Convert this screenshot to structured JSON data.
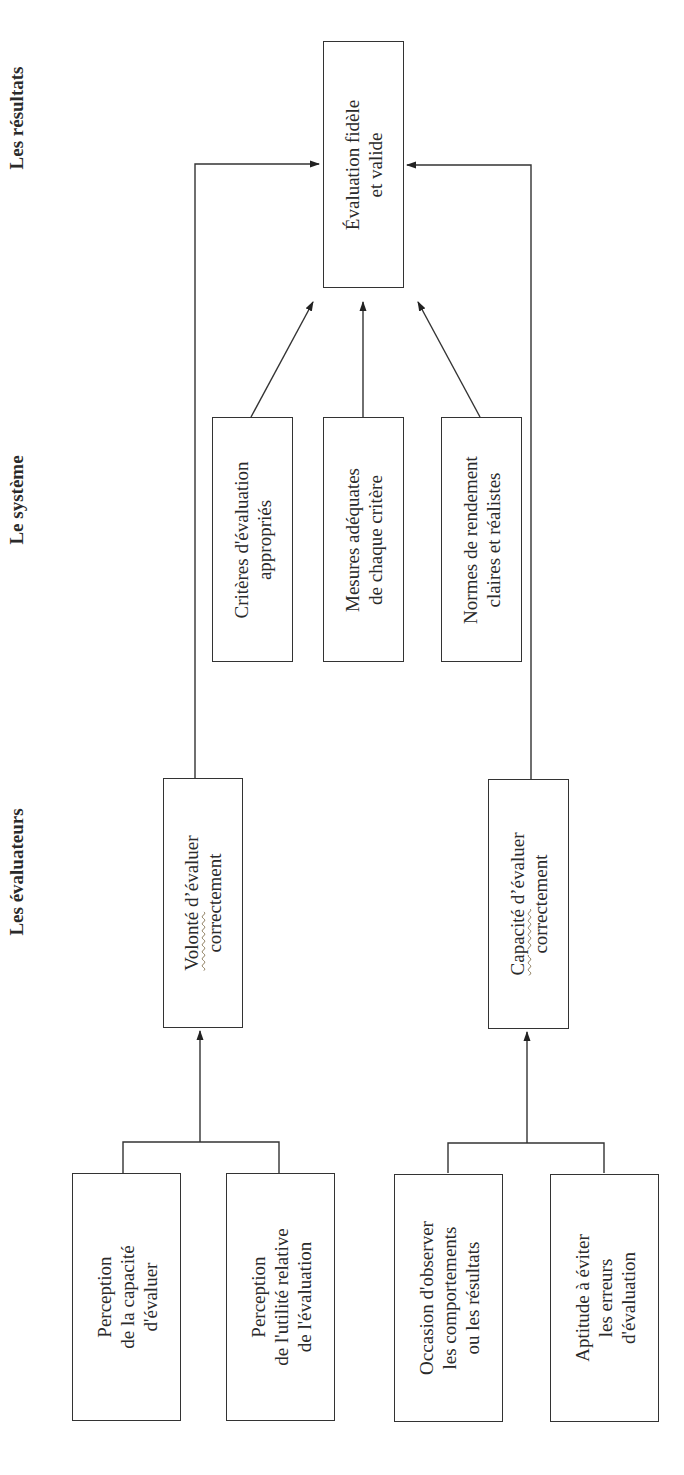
{
  "headers": {
    "results": "Les résultats",
    "system": "Le système",
    "evaluators": "Les évaluateurs"
  },
  "result_box": {
    "lines": [
      "Évaluation fidèle",
      "et valide"
    ]
  },
  "system_boxes": [
    {
      "lines": [
        "Critères d'évaluation",
        "appropriés"
      ]
    },
    {
      "lines": [
        "Mesures adéquates",
        "de chaque critère"
      ]
    },
    {
      "lines": [
        "Normes de rendement",
        "claires et réalistes"
      ]
    }
  ],
  "evaluator_boxes": [
    {
      "lines": [
        "Volonté d'évaluer",
        "correctement"
      ],
      "underlined_word": "Volonté"
    },
    {
      "lines": [
        "Capacité d'évaluer",
        "correctement"
      ],
      "underlined_word": "Capacité"
    }
  ],
  "factor_boxes": [
    {
      "lines": [
        "Perception",
        "de la capacité",
        "d'évaluer"
      ]
    },
    {
      "lines": [
        "Perception",
        "de l'utilité relative",
        "de l'évaluation"
      ]
    },
    {
      "lines": [
        "Occasion d'observer",
        "les comportements",
        "ou les résultats"
      ]
    },
    {
      "lines": [
        "Aptitude à éviter",
        "les erreurs",
        "d'évaluation"
      ]
    }
  ],
  "colors": {
    "stroke": "#333333",
    "text": "#2a2a2a",
    "background": "#ffffff"
  }
}
